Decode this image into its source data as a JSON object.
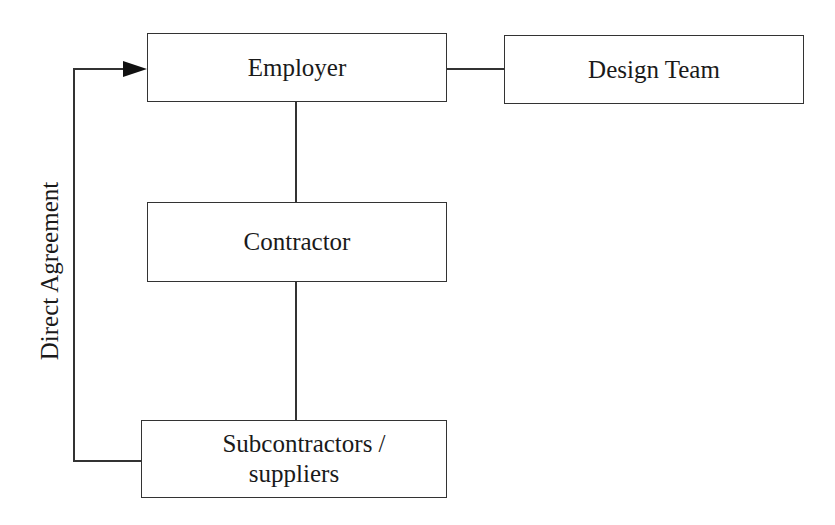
{
  "diagram": {
    "nodes": {
      "employer": {
        "label": "Employer"
      },
      "design_team": {
        "label": "Design Team"
      },
      "contractor": {
        "label": "Contractor"
      },
      "subcontractors": {
        "label_line1": "Subcontractors /",
        "label_line2": "suppliers"
      }
    },
    "edges": [
      {
        "from": "employer",
        "to": "design_team",
        "type": "line"
      },
      {
        "from": "employer",
        "to": "contractor",
        "type": "line"
      },
      {
        "from": "contractor",
        "to": "subcontractors",
        "type": "line"
      },
      {
        "from": "subcontractors",
        "to": "employer",
        "type": "arrow",
        "label": "Direct Agreement"
      }
    ],
    "direct_agreement_label": "Direct Agreement",
    "colors": {
      "stroke": "#333333",
      "background": "#ffffff",
      "text": "#1a1a1a"
    }
  }
}
